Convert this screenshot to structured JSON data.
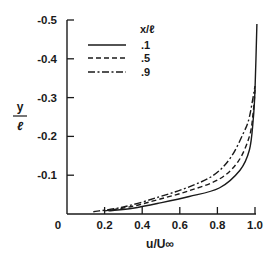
{
  "chart_data": {
    "type": "line",
    "title": "",
    "xlabel": "u/U∞",
    "ylabel_num": "y",
    "ylabel_den": "ℓ",
    "xlim": [
      0,
      1.0
    ],
    "ylim": [
      0,
      -0.5
    ],
    "x_ticks": [
      "0",
      "0.2",
      "0.4",
      "0.6",
      "0.8",
      "1.0"
    ],
    "x_tick_values": [
      0,
      0.2,
      0.4,
      0.6,
      0.8,
      1.0
    ],
    "y_ticks": [
      "-0.1",
      "-0.2",
      "-0.3",
      "-0.4",
      "-0.5"
    ],
    "y_tick_values": [
      -0.1,
      -0.2,
      -0.3,
      -0.4,
      -0.5
    ],
    "grid": false,
    "legend": {
      "title": "x/ℓ",
      "position": "upper-left inside",
      "entries": [
        {
          "label": ".1",
          "style": "solid"
        },
        {
          "label": ".5",
          "style": "dashed"
        },
        {
          "label": ".9",
          "style": "dash-dot"
        }
      ]
    },
    "series": [
      {
        "name": "x/ℓ = .1",
        "style": "solid",
        "points": [
          [
            0.22,
            -0.008
          ],
          [
            0.35,
            -0.015
          ],
          [
            0.49,
            -0.028
          ],
          [
            0.65,
            -0.045
          ],
          [
            0.81,
            -0.067
          ],
          [
            0.92,
            -0.113
          ],
          [
            0.97,
            -0.165
          ],
          [
            0.99,
            -0.24
          ],
          [
            1.0,
            -0.32
          ],
          [
            1.01,
            -0.49
          ]
        ]
      },
      {
        "name": "x/ℓ = .5",
        "style": "dashed",
        "points": [
          [
            0.2,
            -0.008
          ],
          [
            0.35,
            -0.02
          ],
          [
            0.49,
            -0.038
          ],
          [
            0.65,
            -0.06
          ],
          [
            0.81,
            -0.09
          ],
          [
            0.91,
            -0.135
          ],
          [
            0.97,
            -0.2
          ],
          [
            0.99,
            -0.26
          ],
          [
            1.0,
            -0.32
          ]
        ]
      },
      {
        "name": "x/ℓ = .9",
        "style": "dash-dot",
        "points": [
          [
            0.14,
            -0.006
          ],
          [
            0.3,
            -0.018
          ],
          [
            0.49,
            -0.044
          ],
          [
            0.65,
            -0.07
          ],
          [
            0.78,
            -0.1
          ],
          [
            0.87,
            -0.145
          ],
          [
            0.94,
            -0.21
          ],
          [
            0.97,
            -0.25
          ],
          [
            1.0,
            -0.33
          ]
        ]
      }
    ]
  }
}
